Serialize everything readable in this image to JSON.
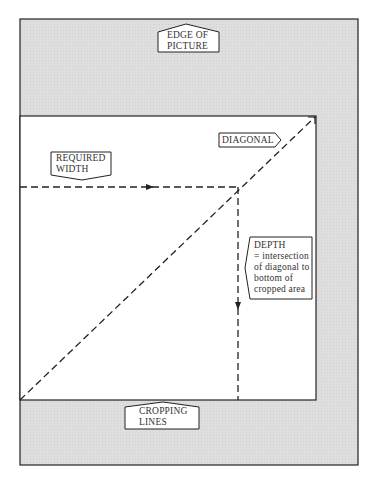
{
  "diagram": {
    "colors": {
      "margin": "#dadada",
      "crop_area": "#ffffff",
      "line": "#222222"
    },
    "labels": {
      "edge_of_picture": [
        "EDGE OF",
        "PICTURE"
      ],
      "diagonal": "DIAGONAL",
      "required_width": [
        "REQUIRED",
        "WIDTH"
      ],
      "depth": [
        "DEPTH",
        "= intersection",
        "of diagonal to",
        "bottom of",
        "cropped area"
      ],
      "cropping_lines": [
        "CROPPING",
        "LINES"
      ]
    }
  }
}
